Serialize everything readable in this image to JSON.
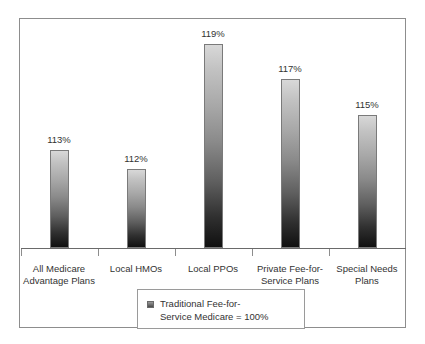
{
  "chart_data": {
    "type": "bar",
    "title": "",
    "subtitle": "",
    "xlabel": "",
    "ylabel": "",
    "categories": [
      "All Medicare\nAdvantage Plans",
      "Local HMOs",
      "Local PPOs",
      "Private Fee-for-\nService Plans",
      "Special Needs\nPlans"
    ],
    "values": [
      113,
      112,
      119,
      117,
      115
    ],
    "value_labels": [
      "113%",
      "112%",
      "119%",
      "117%",
      "115%"
    ],
    "unit": "%",
    "ylim": [
      100,
      121
    ],
    "grid": false,
    "legend_position": "bottom",
    "legend": [
      {
        "label": "Traditional Fee-for-\nService Medicare = 100%",
        "swatch_color": "#4a4a4a"
      }
    ],
    "reference_value": 100,
    "axis_line_color": "#6a6a6a",
    "bar_top_color": "#d8d8d8",
    "bar_bottom_color": "#101010",
    "frame_color": "#8d8d8d"
  },
  "legend": {
    "entry_label": "Traditional Fee-for-\nService Medicare = 100%"
  }
}
